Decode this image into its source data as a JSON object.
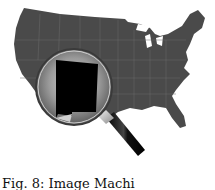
{
  "figure": {
    "highlighted_state": "New Mexico",
    "map_color": "#4a4a4a",
    "state_border_color": "#6a6a6a",
    "highlight_color": "#000000",
    "handle_color": "#111111"
  },
  "caption": {
    "text": "Fig. 8: Image Machi"
  }
}
